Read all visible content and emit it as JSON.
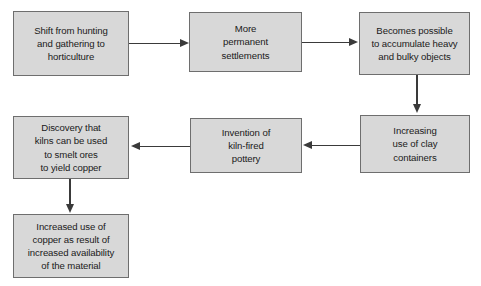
{
  "diagram": {
    "type": "flowchart",
    "title": "",
    "nodes": [
      {
        "id": "n1",
        "label": "Shift from hunting\nand gathering to\nhorticulture",
        "x": 13,
        "y": 11,
        "w": 116,
        "h": 65
      },
      {
        "id": "n2",
        "label": "More\npermanent\nsettlements",
        "x": 189,
        "y": 12,
        "w": 113,
        "h": 60
      },
      {
        "id": "n3",
        "label": "Becomes possible\nto accumulate heavy\nand bulky objects",
        "x": 359,
        "y": 12,
        "w": 111,
        "h": 63
      },
      {
        "id": "n4",
        "label": "Increasing\nuse of clay\ncontainers",
        "x": 360,
        "y": 115,
        "w": 110,
        "h": 58
      },
      {
        "id": "n5",
        "label": "Invention of\nkiln-fired\npottery",
        "x": 190,
        "y": 118,
        "w": 112,
        "h": 55
      },
      {
        "id": "n6",
        "label": "Discovery that\nkilns can be used\nto smelt ores\nto yield copper",
        "x": 13,
        "y": 116,
        "w": 116,
        "h": 63
      },
      {
        "id": "n7",
        "label": "Increased use of\ncopper as result of\nincreased availability\nof the material",
        "x": 13,
        "y": 214,
        "w": 116,
        "h": 64
      }
    ],
    "edges": [
      {
        "id": "e1",
        "from": "n1",
        "to": "n2",
        "direction": "right"
      },
      {
        "id": "e2",
        "from": "n2",
        "to": "n3",
        "direction": "right"
      },
      {
        "id": "e3",
        "from": "n3",
        "to": "n4",
        "direction": "down"
      },
      {
        "id": "e4",
        "from": "n4",
        "to": "n5",
        "direction": "left"
      },
      {
        "id": "e5",
        "from": "n5",
        "to": "n6",
        "direction": "left"
      },
      {
        "id": "e6",
        "from": "n6",
        "to": "n7",
        "direction": "down"
      }
    ],
    "colors": {
      "node_fill": "#d8d8d8",
      "node_border": "#6e6e6e",
      "edge": "#3a3a3a",
      "text": "#1a1a1a",
      "background": "#ffffff"
    }
  }
}
